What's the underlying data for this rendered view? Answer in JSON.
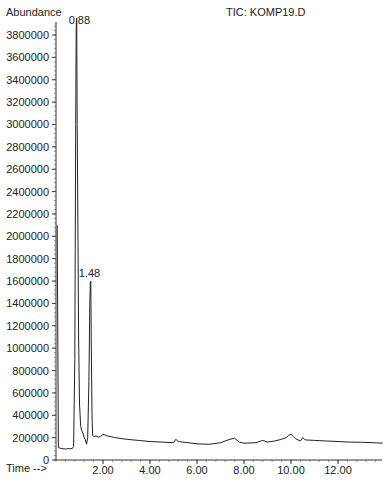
{
  "chart_data": {
    "type": "line",
    "title": "TIC: KOMP19.D",
    "ylabel": "Abundance",
    "xlabel": "Time -->",
    "ylim": [
      0,
      3900000
    ],
    "xlim": [
      0,
      13.9
    ],
    "y_ticks": [
      0,
      200000,
      400000,
      600000,
      800000,
      1000000,
      1200000,
      1400000,
      1600000,
      1800000,
      2000000,
      2200000,
      2400000,
      2600000,
      2800000,
      3000000,
      3200000,
      3400000,
      3600000,
      3800000
    ],
    "y_tick_labels": [
      "0",
      "200000",
      "400000",
      "600000",
      "800000",
      "1000000",
      "1200000",
      "1400000",
      "1600000",
      "1800000",
      "2000000",
      "2200000",
      "2400000",
      "2600000",
      "2800000",
      "3000000",
      "3200000",
      "3400000",
      "3600000",
      "3800000"
    ],
    "x_ticks": [
      2,
      4,
      6,
      8,
      10,
      12
    ],
    "x_tick_labels": [
      "2.00",
      "4.00",
      "6.00",
      "8.00",
      "10.00",
      "12.00"
    ],
    "annotations": [
      {
        "x": 0.88,
        "label": "0.88"
      },
      {
        "x": 1.48,
        "label": "1.48"
      }
    ],
    "series": [
      {
        "name": "TIC",
        "x": [
          0.05,
          0.1,
          0.2,
          0.3,
          0.4,
          0.5,
          0.6,
          0.7,
          0.75,
          0.8,
          0.84,
          0.86,
          0.88,
          0.9,
          0.93,
          0.96,
          1.0,
          1.05,
          1.1,
          1.15,
          1.2,
          1.25,
          1.3,
          1.35,
          1.4,
          1.44,
          1.46,
          1.48,
          1.5,
          1.53,
          1.56,
          1.6,
          1.7,
          1.8,
          1.9,
          2.0,
          2.2,
          2.5,
          3.0,
          3.5,
          4.0,
          4.5,
          5.0,
          5.1,
          5.2,
          5.4,
          6.0,
          6.5,
          7.0,
          7.4,
          7.6,
          7.8,
          8.0,
          8.5,
          8.8,
          9.0,
          9.3,
          9.6,
          9.8,
          9.9,
          10.0,
          10.1,
          10.2,
          10.4,
          10.5,
          10.6,
          11.0,
          11.5,
          12.0,
          12.5,
          13.0,
          13.5,
          13.9
        ],
        "values": [
          2100000,
          110000,
          105000,
          100000,
          98000,
          102000,
          100000,
          105000,
          120000,
          900000,
          3000000,
          3850000,
          3950000,
          3000000,
          2100000,
          1100000,
          500000,
          300000,
          260000,
          240000,
          200000,
          180000,
          140000,
          200000,
          700000,
          1400000,
          1580000,
          1600000,
          1000000,
          400000,
          220000,
          210000,
          215000,
          205000,
          210000,
          230000,
          215000,
          200000,
          185000,
          175000,
          165000,
          160000,
          155000,
          185000,
          165000,
          160000,
          145000,
          140000,
          155000,
          185000,
          195000,
          160000,
          150000,
          155000,
          175000,
          160000,
          170000,
          185000,
          200000,
          220000,
          230000,
          210000,
          190000,
          170000,
          200000,
          180000,
          175000,
          170000,
          165000,
          160000,
          158000,
          155000,
          150000
        ]
      }
    ]
  }
}
